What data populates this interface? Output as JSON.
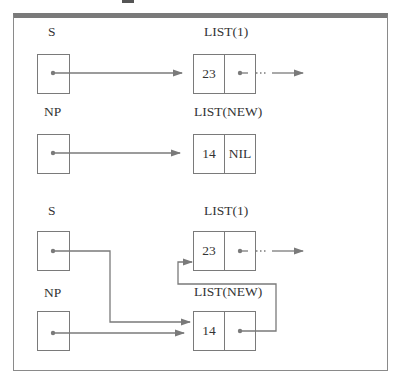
{
  "diagram": {
    "title": "",
    "panels": [
      {
        "name": "before",
        "pointers": [
          {
            "label": "S",
            "target": "LIST(1)"
          },
          {
            "label": "NP",
            "target": "LIST(NEW)"
          }
        ],
        "nodes": [
          {
            "label": "LIST(1)",
            "value": "23",
            "next": "...",
            "next_kind": "pointer"
          },
          {
            "label": "LIST(NEW)",
            "value": "14",
            "next": "NIL",
            "next_kind": "nil"
          }
        ]
      },
      {
        "name": "after",
        "pointers": [
          {
            "label": "S",
            "target": "LIST(NEW)"
          },
          {
            "label": "NP",
            "target": "LIST(NEW)"
          }
        ],
        "nodes": [
          {
            "label": "LIST(1)",
            "value": "23",
            "next": "...",
            "next_kind": "pointer"
          },
          {
            "label": "LIST(NEW)",
            "value": "14",
            "next": "LIST(1)",
            "next_kind": "pointer"
          }
        ]
      }
    ],
    "labels": {
      "s": "S",
      "np": "NP",
      "list1": "LIST(1)",
      "listnew": "LIST(NEW)",
      "v23": "23",
      "v14": "14",
      "nil": "NIL",
      "ellipsis": "···"
    },
    "colors": {
      "line": "#7a7a7a",
      "text": "#333333",
      "frame": "#8a8a8a"
    }
  }
}
